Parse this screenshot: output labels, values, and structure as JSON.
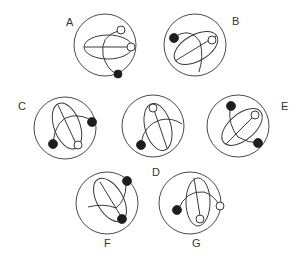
{
  "diagram": {
    "type": "visual-analogy-puzzle",
    "colors": {
      "line": "#3a3a3a",
      "filled_dot": "#1e1e1e",
      "background": "#ffffff"
    },
    "figures": [
      {
        "label": "A",
        "cx": 105,
        "cy": 45,
        "r": 31
      },
      {
        "label": "B",
        "cx": 195,
        "cy": 45,
        "r": 31
      },
      {
        "label": "C",
        "cx": 65,
        "cy": 128,
        "r": 31
      },
      {
        "label": "D",
        "cx": 153,
        "cy": 126,
        "r": 31
      },
      {
        "label": "E",
        "cx": 238,
        "cy": 126,
        "r": 31
      },
      {
        "label": "F",
        "cx": 107,
        "cy": 203,
        "r": 31
      },
      {
        "label": "G",
        "cx": 190,
        "cy": 203,
        "r": 31
      }
    ]
  }
}
